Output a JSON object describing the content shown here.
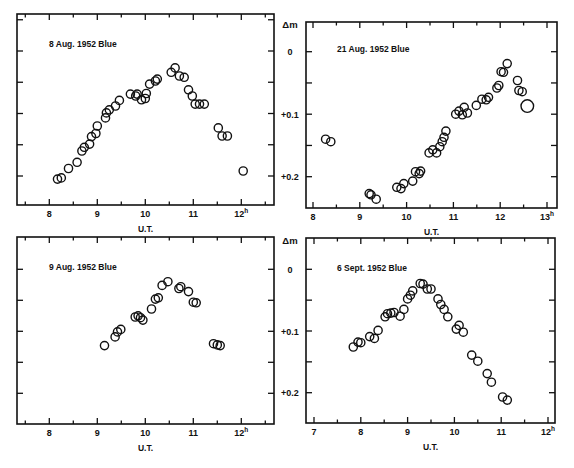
{
  "figure": {
    "shared_ylabel": "Δm",
    "ytick_labels": [
      "0",
      "+0.1",
      "+0.2"
    ]
  },
  "chart_data": [
    {
      "type": "scatter",
      "title": "8 Aug. 1952   Blue",
      "xlabel": "U.T.",
      "ylabel": "Δm",
      "xticks": [
        "8",
        "9",
        "10",
        "11",
        "12h"
      ],
      "xlim": [
        7.35,
        12.65
      ],
      "ylim": [
        -0.06,
        0.245
      ],
      "y_inverted": true,
      "grid": false,
      "frame": {
        "x0": 17,
        "x1": 274,
        "y0": 14,
        "y1": 205
      },
      "xmap": {
        "t0": 8,
        "px0": 49.3,
        "pxPerHour": 48
      },
      "ymap": {
        "m0": 0,
        "py0": 51,
        "pxPerMag": 625
      },
      "points": [
        [
          8.17,
          0.205
        ],
        [
          8.25,
          0.203
        ],
        [
          8.4,
          0.188
        ],
        [
          8.58,
          0.178
        ],
        [
          8.68,
          0.16
        ],
        [
          8.73,
          0.154
        ],
        [
          8.84,
          0.149
        ],
        [
          8.88,
          0.137
        ],
        [
          8.97,
          0.132
        ],
        [
          9.0,
          0.12
        ],
        [
          9.17,
          0.107
        ],
        [
          9.19,
          0.099
        ],
        [
          9.25,
          0.094
        ],
        [
          9.38,
          0.088
        ],
        [
          9.46,
          0.079
        ],
        [
          9.69,
          0.069
        ],
        [
          9.8,
          0.072
        ],
        [
          9.83,
          0.069
        ],
        [
          9.92,
          0.078
        ],
        [
          10.0,
          0.076
        ],
        [
          10.02,
          0.068
        ],
        [
          10.09,
          0.053
        ],
        [
          10.21,
          0.048
        ],
        [
          10.25,
          0.045
        ],
        [
          10.54,
          0.034
        ],
        [
          10.62,
          0.027
        ],
        [
          10.71,
          0.04
        ],
        [
          10.81,
          0.042
        ],
        [
          10.9,
          0.062
        ],
        [
          10.98,
          0.072
        ],
        [
          11.04,
          0.085
        ],
        [
          11.13,
          0.085
        ],
        [
          11.23,
          0.085
        ],
        [
          11.52,
          0.123
        ],
        [
          11.6,
          0.136
        ],
        [
          11.71,
          0.136
        ],
        [
          12.04,
          0.192
        ]
      ]
    },
    {
      "type": "scatter",
      "title": "21 Aug. 1952   Blue",
      "xlabel": "U.T.",
      "ylabel": "Δm",
      "xticks": [
        "8",
        "9",
        "10",
        "11",
        "12",
        "13h"
      ],
      "xlim": [
        7.85,
        13.2
      ],
      "ylim": [
        -0.045,
        0.25
      ],
      "y_inverted": true,
      "grid": false,
      "frame": {
        "x0": 306,
        "x1": 557,
        "y0": 22,
        "y1": 208
      },
      "xmap": {
        "t0": 8,
        "px0": 313,
        "pxPerHour": 46.8
      },
      "ymap": {
        "m0": 0,
        "py0": 51.7,
        "pxPerMag": 625
      },
      "points": [
        [
          8.27,
          0.14
        ],
        [
          8.38,
          0.144
        ],
        [
          9.2,
          0.227
        ],
        [
          9.24,
          0.229
        ],
        [
          9.35,
          0.236
        ],
        [
          9.79,
          0.217
        ],
        [
          9.88,
          0.219
        ],
        [
          9.94,
          0.211
        ],
        [
          10.13,
          0.207
        ],
        [
          10.19,
          0.192
        ],
        [
          10.27,
          0.195
        ],
        [
          10.3,
          0.191
        ],
        [
          10.48,
          0.162
        ],
        [
          10.56,
          0.157
        ],
        [
          10.64,
          0.162
        ],
        [
          10.71,
          0.152
        ],
        [
          10.76,
          0.144
        ],
        [
          10.8,
          0.137
        ],
        [
          10.84,
          0.127
        ],
        [
          11.05,
          0.1
        ],
        [
          11.12,
          0.095
        ],
        [
          11.19,
          0.101
        ],
        [
          11.23,
          0.089
        ],
        [
          11.3,
          0.098
        ],
        [
          11.49,
          0.086
        ],
        [
          11.61,
          0.076
        ],
        [
          11.7,
          0.077
        ],
        [
          11.75,
          0.073
        ],
        [
          11.93,
          0.058
        ],
        [
          11.97,
          0.054
        ],
        [
          12.02,
          0.032
        ],
        [
          12.07,
          0.033
        ],
        [
          12.15,
          0.019
        ],
        [
          12.37,
          0.046
        ],
        [
          12.4,
          0.062
        ],
        [
          12.47,
          0.064
        ],
        [
          12.58,
          0.087,
          "large"
        ]
      ]
    },
    {
      "type": "scatter",
      "title": "9 Aug. 1952   Blue",
      "xlabel": "U.T.",
      "ylabel": "Δm",
      "xticks": [
        "8",
        "9",
        "10",
        "11",
        "12h"
      ],
      "xlim": [
        7.35,
        12.65
      ],
      "ylim": [
        -0.05,
        0.25
      ],
      "y_inverted": true,
      "grid": false,
      "frame": {
        "x0": 17,
        "x1": 274,
        "y0": 237,
        "y1": 424
      },
      "xmap": {
        "t0": 8,
        "px0": 49.3,
        "pxPerHour": 48
      },
      "ymap": {
        "m0": 0,
        "py0": 269.3,
        "pxPerMag": 620
      },
      "points": [
        [
          9.15,
          0.123
        ],
        [
          9.37,
          0.109
        ],
        [
          9.42,
          0.101
        ],
        [
          9.49,
          0.097
        ],
        [
          9.79,
          0.077
        ],
        [
          9.85,
          0.075
        ],
        [
          9.9,
          0.078
        ],
        [
          9.95,
          0.082
        ],
        [
          10.13,
          0.064
        ],
        [
          10.21,
          0.048
        ],
        [
          10.27,
          0.046
        ],
        [
          10.35,
          0.026
        ],
        [
          10.47,
          0.02
        ],
        [
          10.7,
          0.031
        ],
        [
          10.74,
          0.028
        ],
        [
          10.9,
          0.036
        ],
        [
          11.0,
          0.053
        ],
        [
          11.06,
          0.054
        ],
        [
          11.42,
          0.12
        ],
        [
          11.5,
          0.122
        ],
        [
          11.56,
          0.123
        ]
      ]
    },
    {
      "type": "scatter",
      "title": "6 Sept. 1952   Blue",
      "xlabel": "U.T.",
      "ylabel": "Δm",
      "xticks": [
        "7",
        "8",
        "9",
        "10",
        "11",
        "12h"
      ],
      "xlim": [
        6.85,
        12.15
      ],
      "ylim": [
        -0.05,
        0.25
      ],
      "y_inverted": true,
      "grid": false,
      "frame": {
        "x0": 306,
        "x1": 555,
        "y0": 238,
        "y1": 423
      },
      "xmap": {
        "t0": 7,
        "px0": 314,
        "pxPerHour": 46.8
      },
      "ymap": {
        "m0": 0,
        "py0": 269.3,
        "pxPerMag": 617
      },
      "points": [
        [
          7.84,
          0.126
        ],
        [
          7.94,
          0.118
        ],
        [
          8.0,
          0.119
        ],
        [
          8.19,
          0.109
        ],
        [
          8.29,
          0.112
        ],
        [
          8.37,
          0.099
        ],
        [
          8.52,
          0.077
        ],
        [
          8.57,
          0.072
        ],
        [
          8.64,
          0.071
        ],
        [
          8.71,
          0.07
        ],
        [
          8.84,
          0.076
        ],
        [
          8.92,
          0.065
        ],
        [
          9.0,
          0.048
        ],
        [
          9.06,
          0.042
        ],
        [
          9.11,
          0.035
        ],
        [
          9.27,
          0.023
        ],
        [
          9.33,
          0.024
        ],
        [
          9.42,
          0.032
        ],
        [
          9.5,
          0.032
        ],
        [
          9.65,
          0.048
        ],
        [
          9.71,
          0.057
        ],
        [
          9.78,
          0.065
        ],
        [
          9.86,
          0.077
        ],
        [
          10.04,
          0.097
        ],
        [
          10.1,
          0.091
        ],
        [
          10.19,
          0.102
        ],
        [
          10.37,
          0.139
        ],
        [
          10.5,
          0.149
        ],
        [
          10.7,
          0.169
        ],
        [
          10.79,
          0.183
        ],
        [
          11.03,
          0.207
        ],
        [
          11.13,
          0.212
        ]
      ]
    }
  ]
}
